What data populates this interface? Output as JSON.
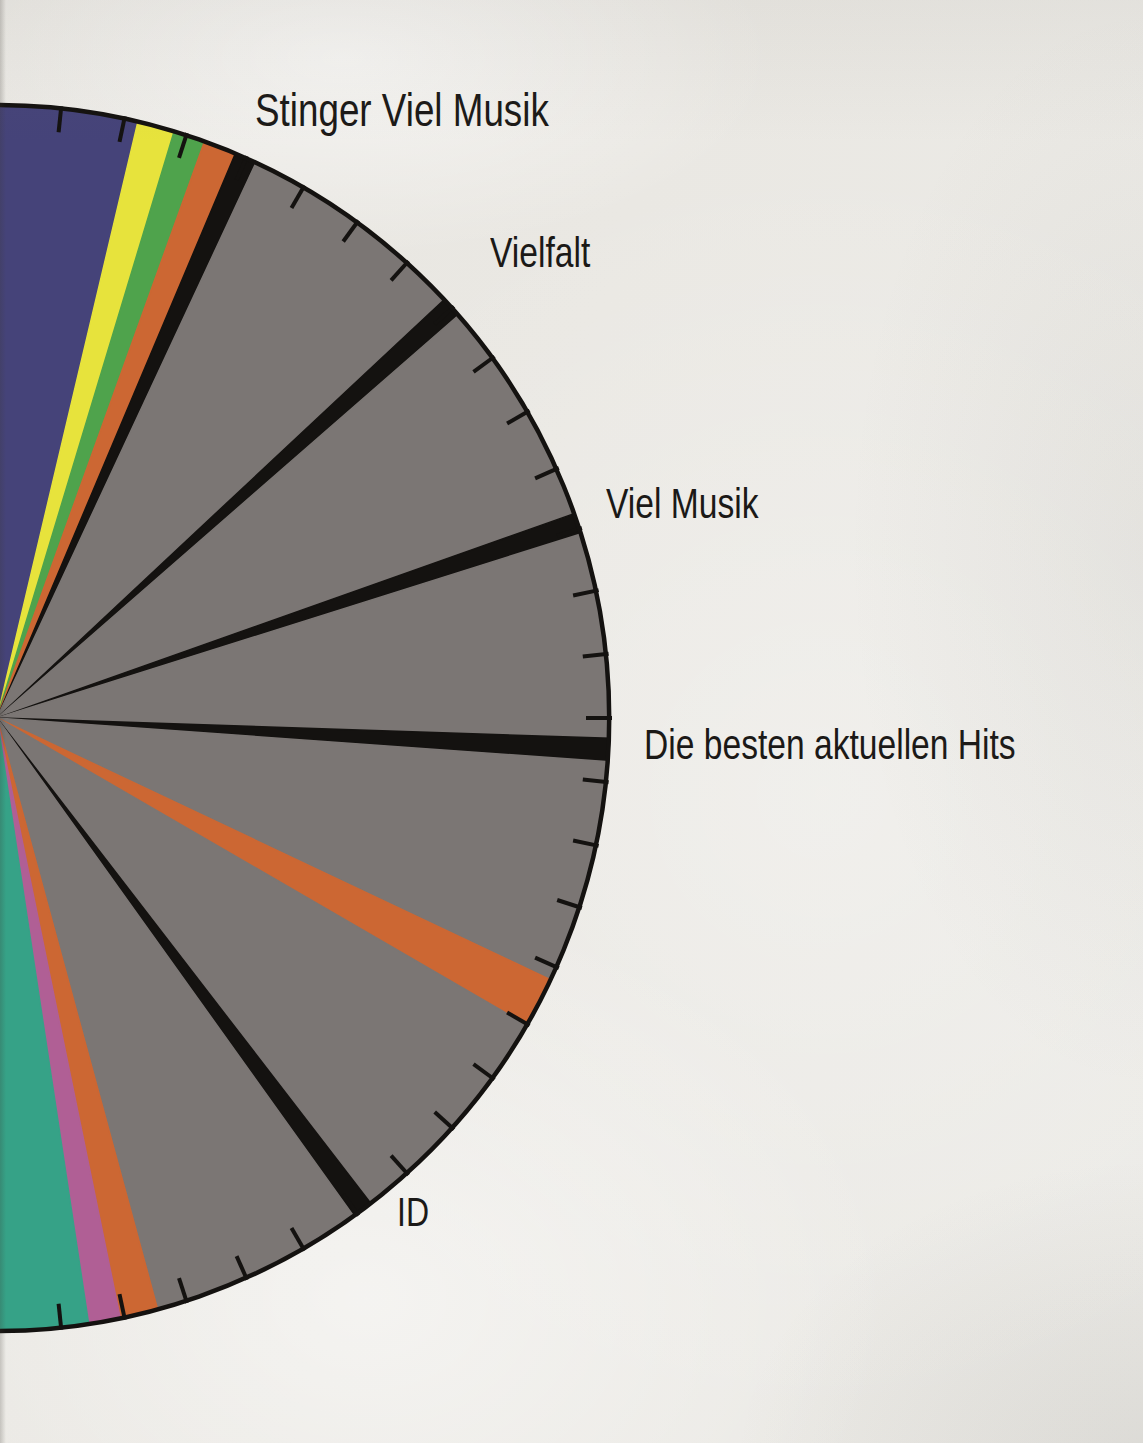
{
  "page": {
    "kind": "scanned book page with radio program hour-clock pie chart",
    "paper_color": "#eae8e3",
    "ink_color": "#1b1917"
  },
  "chart_data": {
    "type": "pie",
    "subtype": "radio-program-hour-clock",
    "title": "",
    "legend_position": "none",
    "grid": "minute ticks every 6 degrees around circumference",
    "center": {
      "x": -3,
      "y": 718
    },
    "radius": 613,
    "arc_start_deg": -3,
    "arc_end_deg": 183,
    "arc_stroke": "#141210",
    "arc_stroke_width": 4.5,
    "tick_interval_deg": 6,
    "tick_inner_offset": 24,
    "tick_outer_offset": 2,
    "tick_width": 4,
    "tick_color": "#141210",
    "angles_measured_clockwise_from_12_oclock": true,
    "segments": [
      {
        "color_name": "navy",
        "label": "",
        "color": "#454379",
        "start_deg": -3.0,
        "end_deg": 13.3
      },
      {
        "color_name": "yellow",
        "label": "",
        "color": "#e7e33c",
        "start_deg": 13.3,
        "end_deg": 16.8
      },
      {
        "color_name": "green",
        "label": "",
        "color": "#4fa34c",
        "start_deg": 16.8,
        "end_deg": 19.8
      },
      {
        "color_name": "orange",
        "label": "",
        "color": "#cc6733",
        "start_deg": 19.8,
        "end_deg": 22.9
      },
      {
        "color_name": "black",
        "label": "Stinger Viel Musik",
        "color": "#141210",
        "start_deg": 22.9,
        "end_deg": 25.0
      },
      {
        "color_name": "gray",
        "label": "",
        "color": "#7b7674",
        "start_deg": 25.0,
        "end_deg": 46.9
      },
      {
        "color_name": "black",
        "label": "Vielfalt",
        "color": "#141210",
        "start_deg": 46.9,
        "end_deg": 48.9
      },
      {
        "color_name": "gray",
        "label": "",
        "color": "#7b7674",
        "start_deg": 48.9,
        "end_deg": 70.5
      },
      {
        "color_name": "black",
        "label": "Viel Musik",
        "color": "#141210",
        "start_deg": 70.5,
        "end_deg": 72.5
      },
      {
        "color_name": "gray",
        "label": "",
        "color": "#7b7674",
        "start_deg": 72.5,
        "end_deg": 91.9
      },
      {
        "color_name": "black",
        "label": "Die besten aktuellen Hits",
        "color": "#141210",
        "start_deg": 91.9,
        "end_deg": 94.1
      },
      {
        "color_name": "gray",
        "label": "",
        "color": "#7b7674",
        "start_deg": 94.1,
        "end_deg": 115.3
      },
      {
        "color_name": "orange",
        "label": "",
        "color": "#cc6733",
        "start_deg": 115.3,
        "end_deg": 120.1
      },
      {
        "color_name": "gray",
        "label": "",
        "color": "#7b7674",
        "start_deg": 120.1,
        "end_deg": 142.4
      },
      {
        "color_name": "black",
        "label": "ID",
        "color": "#141210",
        "start_deg": 142.4,
        "end_deg": 144.4
      },
      {
        "color_name": "gray",
        "label": "",
        "color": "#7b7674",
        "start_deg": 144.4,
        "end_deg": 164.8
      },
      {
        "color_name": "orange",
        "label": "",
        "color": "#cc6733",
        "start_deg": 164.8,
        "end_deg": 168.4
      },
      {
        "color_name": "magenta",
        "label": "",
        "color": "#b05f95",
        "start_deg": 168.4,
        "end_deg": 171.4
      },
      {
        "color_name": "teal",
        "label": "",
        "color": "#36a287",
        "start_deg": 171.4,
        "end_deg": 183.0
      }
    ],
    "annotations": [
      {
        "text": "Stinger Viel Musik",
        "x": 255,
        "y": 84,
        "font_px": 46
      },
      {
        "text": "Vielfalt",
        "x": 490,
        "y": 229,
        "font_px": 42
      },
      {
        "text": "Viel Musik",
        "x": 606,
        "y": 480,
        "font_px": 42
      },
      {
        "text": "Die besten aktuellen Hits",
        "x": 644,
        "y": 721,
        "font_px": 42
      },
      {
        "text": "ID",
        "x": 397,
        "y": 1189,
        "font_px": 40
      }
    ]
  }
}
